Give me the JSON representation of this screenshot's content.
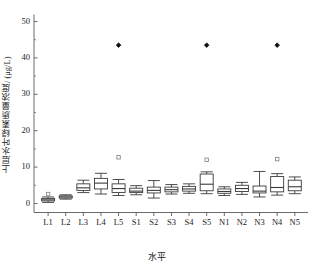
{
  "chart_data": {
    "type": "box",
    "title": "",
    "xlabel": "水平",
    "ylabel": "上层水叶绿素质量浓度/ (μg/L)",
    "ylim": [
      0,
      50
    ],
    "yticks": [
      0,
      10,
      20,
      30,
      40,
      50
    ],
    "ytick_labels": [
      "0",
      "10",
      "20",
      "30",
      "40",
      "50"
    ],
    "grid": false,
    "legend": "none",
    "categories": [
      "L1",
      "L2",
      "L3",
      "L4",
      "L5",
      "S1",
      "S2",
      "S3",
      "S4",
      "S5",
      "N1",
      "N2",
      "N3",
      "N4",
      "N5"
    ],
    "boxes": [
      {
        "category": "L1",
        "min": 0.3,
        "q1": 0.7,
        "median": 1.0,
        "q3": 1.4,
        "max": 1.8,
        "outliers": [
          2.6
        ]
      },
      {
        "category": "L2",
        "min": 1.2,
        "q1": 1.5,
        "median": 1.8,
        "q3": 2.1,
        "max": 2.4,
        "outliers": []
      },
      {
        "category": "L3",
        "min": 3.0,
        "q1": 3.6,
        "median": 4.3,
        "q3": 5.4,
        "max": 6.4,
        "outliers": []
      },
      {
        "category": "L4",
        "min": 2.6,
        "q1": 4.0,
        "median": 5.6,
        "q3": 6.9,
        "max": 8.3,
        "outliers": []
      },
      {
        "category": "L5",
        "min": 2.2,
        "q1": 3.0,
        "median": 4.1,
        "q3": 5.4,
        "max": 6.6,
        "outliers": [
          12.7,
          43.5
        ]
      },
      {
        "category": "S1",
        "min": 2.4,
        "q1": 3.0,
        "median": 3.4,
        "q3": 4.2,
        "max": 4.9,
        "outliers": []
      },
      {
        "category": "S2",
        "min": 1.5,
        "q1": 2.9,
        "median": 3.6,
        "q3": 4.5,
        "max": 6.3,
        "outliers": []
      },
      {
        "category": "S3",
        "min": 2.6,
        "q1": 3.2,
        "median": 3.8,
        "q3": 4.5,
        "max": 5.2,
        "outliers": []
      },
      {
        "category": "S4",
        "min": 2.8,
        "q1": 3.4,
        "median": 4.0,
        "q3": 4.7,
        "max": 5.4,
        "outliers": []
      },
      {
        "category": "S5",
        "min": 2.7,
        "q1": 3.5,
        "median": 5.3,
        "q3": 8.1,
        "max": 8.7,
        "outliers": [
          12.0,
          43.5
        ]
      },
      {
        "category": "N1",
        "min": 2.2,
        "q1": 2.8,
        "median": 3.3,
        "q3": 4.0,
        "max": 4.6,
        "outliers": []
      },
      {
        "category": "N2",
        "min": 2.5,
        "q1": 3.3,
        "median": 4.1,
        "q3": 5.0,
        "max": 5.8,
        "outliers": []
      },
      {
        "category": "N3",
        "min": 1.8,
        "q1": 2.9,
        "median": 3.4,
        "q3": 4.8,
        "max": 8.8,
        "outliers": []
      },
      {
        "category": "N4",
        "min": 2.3,
        "q1": 3.2,
        "median": 4.4,
        "q3": 7.4,
        "max": 8.2,
        "outliers": [
          12.2,
          43.5
        ]
      },
      {
        "category": "N5",
        "min": 2.7,
        "q1": 3.5,
        "median": 4.6,
        "q3": 6.4,
        "max": 7.3,
        "outliers": []
      }
    ],
    "colors": {
      "axis": "#5a5a5a",
      "box_stroke": "#3a3a3a",
      "box_fill": "#ffffff",
      "outlier_open": "#8a8a8a",
      "outlier_filled": "#111111",
      "text": "#1a1a1a"
    }
  }
}
